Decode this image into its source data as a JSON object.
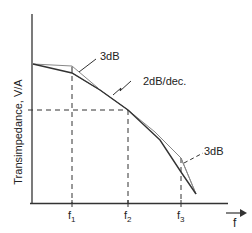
{
  "diagram": {
    "type": "bode-magnitude-sketch",
    "y_axis_label": "Transimpedance, V/A",
    "x_axis_label": "f",
    "x_ticks": [
      {
        "main": "f",
        "sub": "1"
      },
      {
        "main": "f",
        "sub": "2"
      },
      {
        "main": "f",
        "sub": "3"
      }
    ],
    "annotations": {
      "top_3db": "3dB",
      "slope": "2dB/dec.",
      "bottom_3db": "3dB"
    },
    "colors": {
      "axis": "#333333",
      "curve": "#333333",
      "asymptote": "#888888",
      "text": "#222222"
    }
  }
}
